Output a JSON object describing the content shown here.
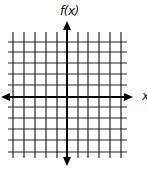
{
  "diagram": {
    "type": "coordinate-plane",
    "y_axis_label": "f(x)",
    "x_axis_label": "x",
    "grid": {
      "vertical_lines_x": [
        13,
        24,
        35,
        46,
        57,
        78,
        88,
        99,
        110,
        121
      ],
      "horizontal_lines_y": [
        42,
        52,
        63,
        74,
        85,
        107,
        118,
        129,
        140,
        152
      ],
      "vertical_span": [
        32,
        158
      ],
      "horizontal_span": [
        8,
        127
      ],
      "line_color": "#222222"
    },
    "axes": {
      "x_axis_y": 97,
      "x_axis_span": [
        1,
        133
      ],
      "y_axis_x": 67,
      "y_axis_span": [
        21,
        166
      ],
      "color": "#000000",
      "arrows": "both-ends"
    },
    "cells_per_quadrant": 5
  }
}
